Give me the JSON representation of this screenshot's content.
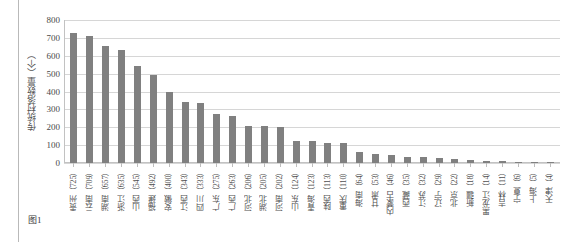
{
  "figure": {
    "caption": "图1"
  },
  "axes": {
    "y_title": "传统村落数量（个）",
    "y_ticks": [
      "800",
      "700",
      "600",
      "500",
      "400",
      "300",
      "200",
      "100",
      "0"
    ]
  },
  "chart_data": {
    "type": "bar",
    "title": "",
    "xlabel": "",
    "ylabel": "传统村落数量（个）",
    "ylim": [
      0,
      800
    ],
    "grid": true,
    "legend": "none",
    "bar_color": "#808080",
    "gridline_color": "#d6d6d6",
    "categories": [
      "贵州（725）",
      "云南（709）",
      "湖南（657）",
      "浙江（635）",
      "山西（545）",
      "福建（492）",
      "安徽（400）",
      "江西（343）",
      "四川（333）",
      "广东（275）",
      "广西（263）",
      "河北（206）",
      "湖北（205）",
      "河南（202）",
      "山东（124）",
      "青海（123）",
      "陕西（113）",
      "重庆（110）",
      "海南（64）",
      "甘肃（53）",
      "内蒙古（46）",
      "西藏（35）",
      "江苏（32）",
      "辽宁（29）",
      "北京（22）",
      "新疆（18）",
      "黑龙江（14）",
      "吉林（11）",
      "宁夏（6）",
      "上海（5）",
      "天津（4）"
    ],
    "values": [
      725,
      709,
      657,
      635,
      545,
      492,
      400,
      343,
      333,
      275,
      263,
      206,
      205,
      202,
      124,
      123,
      113,
      110,
      64,
      53,
      46,
      35,
      32,
      29,
      22,
      18,
      14,
      11,
      6,
      5,
      4
    ]
  }
}
